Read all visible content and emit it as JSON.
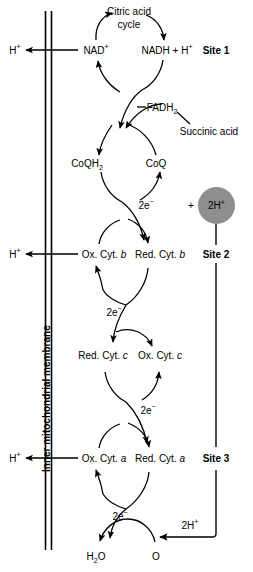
{
  "diagram": {
    "membrane_label": "Inner mitochondrial membrane",
    "colors": {
      "stroke": "#000000",
      "background": "#ffffff",
      "proton_circle_fill": "#8e8e8e"
    }
  },
  "proton_exports": [
    {
      "label": "H",
      "charge": "+"
    },
    {
      "label": "H",
      "charge": "+"
    },
    {
      "label": "H",
      "charge": "+"
    }
  ],
  "sites": [
    {
      "label": "Site 1"
    },
    {
      "label": "Site 2"
    },
    {
      "label": "Site 3"
    }
  ],
  "proton_circle": {
    "count": "2H",
    "charge": "+",
    "plus_sign": "+"
  },
  "proton_input_bottom": {
    "count": "2H",
    "charge": "+"
  },
  "carriers": {
    "citric_acid_cycle_line1": "Citric acid",
    "citric_acid_cycle_line2": "cycle",
    "nad_ox": "NAD",
    "nad_ox_charge": "+",
    "nad_red": "NADH + H",
    "nad_red_charge": "+",
    "fadh2_name": "FADH",
    "fadh2_sub": "2",
    "succinic_acid": "Succinic acid",
    "coq_red": "CoQH",
    "coq_red_sub": "2",
    "coq_ox": "CoQ",
    "cyt_b_ox": "Ox. Cyt. ",
    "cyt_b_ox_italic": "b",
    "cyt_b_red": "Red. Cyt. ",
    "cyt_b_red_italic": "b",
    "cyt_c_red": "Red. Cyt. ",
    "cyt_c_red_italic": "c",
    "cyt_c_ox": "Ox. Cyt. ",
    "cyt_c_ox_italic": "c",
    "cyt_a_ox": "Ox. Cyt. ",
    "cyt_a_ox_italic": "a",
    "cyt_a_red": "Red. Cyt. ",
    "cyt_a_red_italic": "a",
    "water": "H",
    "water_sub": "2",
    "water_tail": "O",
    "oxygen": "O"
  },
  "electron_labels": [
    {
      "text": "2e",
      "charge": "−"
    },
    {
      "text": "2e",
      "charge": "−"
    },
    {
      "text": "2e",
      "charge": "−"
    },
    {
      "text": "2e",
      "charge": "−"
    }
  ]
}
